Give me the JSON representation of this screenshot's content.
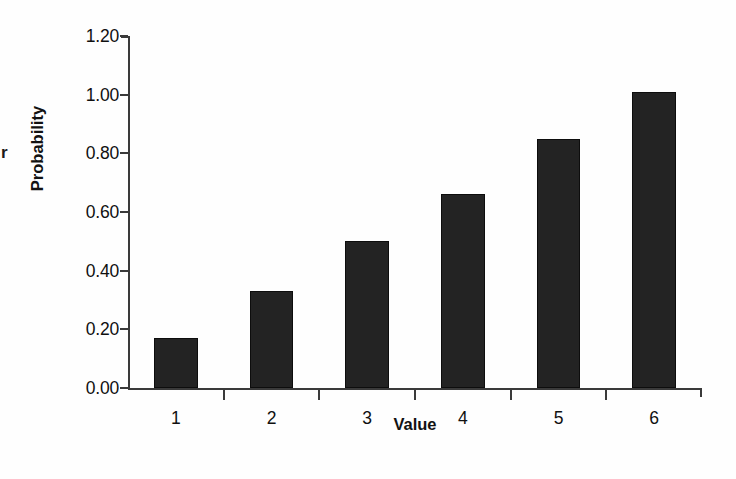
{
  "figure": {
    "margin_artifact": "r",
    "background_color": "#fefefe",
    "bar_color": "#232323",
    "axis_color": "#3a3a3a"
  },
  "chart_data": {
    "type": "bar",
    "title": "",
    "subtitle": "",
    "xlabel": "Value",
    "ylabel": "Probability",
    "categories": [
      "1",
      "2",
      "3",
      "4",
      "5",
      "6"
    ],
    "values": [
      0.17,
      0.33,
      0.5,
      0.66,
      0.85,
      1.01
    ],
    "ylim": [
      0.0,
      1.2
    ],
    "yticks": [
      0.0,
      0.2,
      0.4,
      0.6,
      0.8,
      1.0,
      1.2
    ],
    "ytick_labels": [
      "0.00",
      "0.20",
      "0.40",
      "0.60",
      "0.80",
      "1.00",
      "1.20"
    ],
    "xtick_labels": [
      "1",
      "2",
      "3",
      "4",
      "5",
      "6"
    ],
    "grid": false,
    "legend": null,
    "annotations": [],
    "series": [
      {
        "name": "Probability",
        "values": [
          0.17,
          0.33,
          0.5,
          0.66,
          0.85,
          1.01
        ],
        "color": "#232323"
      }
    ]
  }
}
